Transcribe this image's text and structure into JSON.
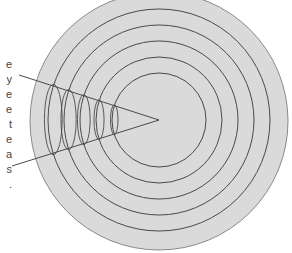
{
  "diagram": {
    "colors": {
      "disk_fill": "#dadada",
      "disk_stroke": "#8a8a8a",
      "line": "#4a4a4a",
      "background": "#ffffff"
    },
    "disk": {
      "cx": 159,
      "cy": 121,
      "r": 129
    },
    "circles": [
      {
        "r": 47
      },
      {
        "r": 63
      },
      {
        "r": 79
      },
      {
        "r": 95
      },
      {
        "r": 111
      }
    ],
    "wedge": {
      "apex": {
        "x": 159,
        "y": 120
      },
      "upper_end": {
        "x": 19,
        "y": 75
      },
      "lower_end": {
        "x": 12,
        "y": 166
      }
    },
    "clipped_text_lines": [
      {
        "text": "e",
        "y": 65
      },
      {
        "text": "y",
        "y": 80
      },
      {
        "text": "e",
        "y": 95
      },
      {
        "text": "e",
        "y": 110
      },
      {
        "text": "t",
        "y": 125
      },
      {
        "text": "e",
        "y": 140
      },
      {
        "text": "a",
        "y": 155
      },
      {
        "text": "s",
        "y": 170
      },
      {
        "text": ".",
        "y": 185
      }
    ]
  }
}
